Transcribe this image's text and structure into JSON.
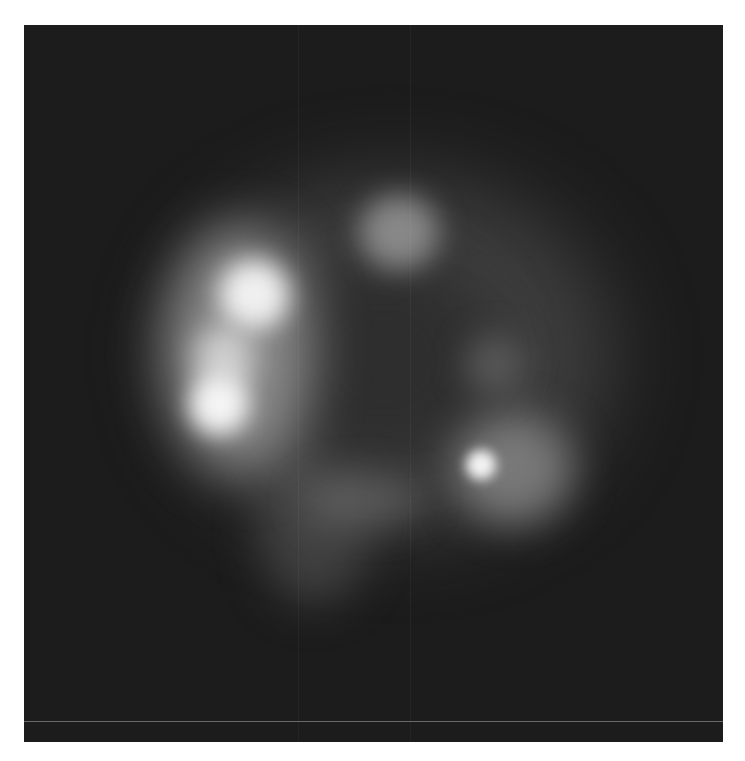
{
  "image": {
    "type": "fluorescence micrograph",
    "colormap": "grayscale",
    "background_color": "#1c1c1c",
    "border_color": "#ffffff",
    "features": [
      {
        "name": "left-bright-arc",
        "intensity": "high"
      },
      {
        "name": "top-blob",
        "intensity": "medium"
      },
      {
        "name": "lower-right-spot",
        "intensity": "high"
      },
      {
        "name": "bottom-protrusion",
        "intensity": "low"
      },
      {
        "name": "cell-body-halo",
        "intensity": "low"
      }
    ]
  }
}
